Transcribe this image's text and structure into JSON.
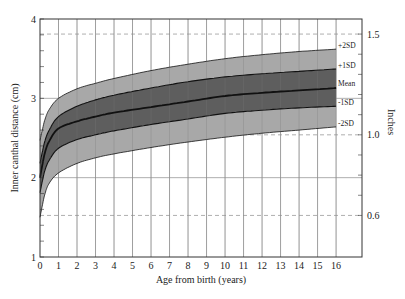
{
  "chart_data": {
    "type": "area",
    "title": "",
    "xlabel": "Age from birth (years)",
    "ylabel": "Inner canthal distance (cm)",
    "y2label": "Inches",
    "xlim": [
      0,
      17.4
    ],
    "ylim": [
      1,
      4
    ],
    "y2lim_inches": [
      0.394,
      1.575
    ],
    "x_ticks": [
      0,
      1,
      2,
      3,
      4,
      5,
      6,
      7,
      8,
      9,
      10,
      11,
      12,
      13,
      14,
      15,
      16
    ],
    "y_ticks": [
      1,
      2,
      3,
      4
    ],
    "y_minor_step": 0.2,
    "y2_ticks_labeled": [
      0.6,
      1.0,
      1.5
    ],
    "y2_minor_step": 0.1,
    "grid": {
      "vertical": true,
      "horizontal_solid_cm": [
        2,
        3
      ],
      "horizontal_dashed_inches": [
        0.6,
        1.0,
        1.5
      ]
    },
    "x": [
      0,
      0.25,
      0.5,
      1,
      2,
      3,
      4,
      6,
      8,
      10,
      12,
      14,
      16
    ],
    "series": [
      {
        "name": "+2SD",
        "values": [
          2.47,
          2.72,
          2.86,
          3.0,
          3.12,
          3.19,
          3.25,
          3.35,
          3.43,
          3.5,
          3.55,
          3.59,
          3.62
        ]
      },
      {
        "name": "+1SD",
        "values": [
          2.18,
          2.45,
          2.6,
          2.77,
          2.9,
          2.98,
          3.04,
          3.13,
          3.21,
          3.27,
          3.31,
          3.34,
          3.37
        ]
      },
      {
        "name": "Mean",
        "values": [
          2.0,
          2.3,
          2.46,
          2.62,
          2.71,
          2.77,
          2.82,
          2.89,
          2.96,
          3.03,
          3.07,
          3.1,
          3.13
        ]
      },
      {
        "name": "-1SD",
        "values": [
          1.81,
          2.08,
          2.22,
          2.37,
          2.48,
          2.54,
          2.59,
          2.67,
          2.74,
          2.81,
          2.85,
          2.88,
          2.9
        ]
      },
      {
        "name": "-2SD",
        "values": [
          1.5,
          1.78,
          1.93,
          2.06,
          2.18,
          2.25,
          2.3,
          2.38,
          2.45,
          2.51,
          2.56,
          2.6,
          2.64
        ]
      }
    ],
    "band_labels": [
      "+2SD",
      "+1SD",
      "Mean",
      "-1SD",
      "-2SD"
    ],
    "colors": {
      "outer_band": "#a8a8a8",
      "inner_band": "#5e5e5e",
      "curve": "#111111",
      "grid": "#9a9a9a",
      "axis": "#333333"
    }
  }
}
